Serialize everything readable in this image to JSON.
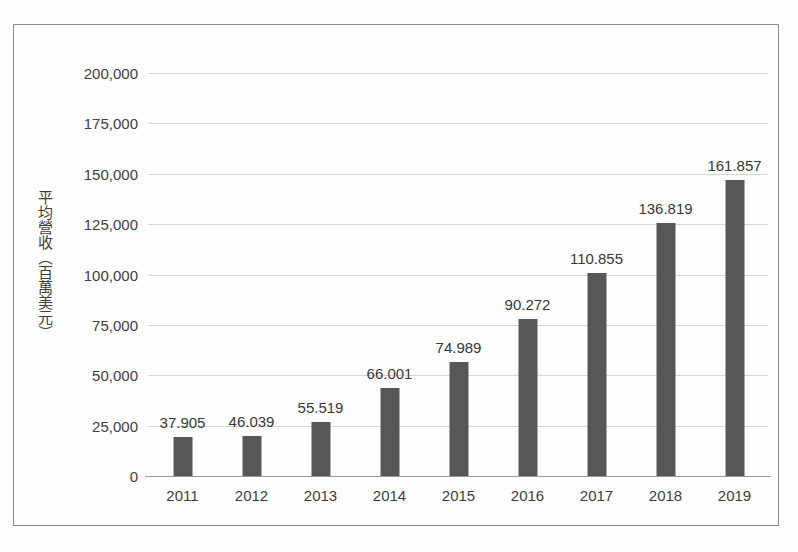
{
  "chart_data": {
    "type": "bar",
    "title": "",
    "subtitle": "",
    "xlabel": "",
    "ylabel": "平均營收（百萬美元）",
    "categories": [
      "2011",
      "2012",
      "2013",
      "2014",
      "2015",
      "2016",
      "2017",
      "2018",
      "2019"
    ],
    "values": [
      37.905,
      46.039,
      55.519,
      66.001,
      74.989,
      90.272,
      110.855,
      136.819,
      161.857
    ],
    "value_labels": [
      "37.905",
      "46.039",
      "55.519",
      "66.001",
      "74.989",
      "90.272",
      "110.855",
      "136.819",
      "161.857"
    ],
    "bar_plotted_values": [
      19500,
      20000,
      27000,
      43500,
      56500,
      78000,
      101000,
      125500,
      147000
    ],
    "ylim": [
      0,
      200000
    ],
    "ytick_labels": [
      "200,000",
      "175,000",
      "150,000",
      "125,000",
      "100,000",
      "75,000",
      "50,000",
      "25,000",
      "0"
    ],
    "ytick_values": [
      200000,
      175000,
      150000,
      125000,
      100000,
      75000,
      50000,
      25000,
      0
    ],
    "grid": true,
    "legend": "none",
    "bar_color": "#575757",
    "gridline_color": "#d6d6d6",
    "axis_color": "#9a9a9a",
    "frame_color": "#8d8d8d",
    "background_color": "#fefefe",
    "text_color": "#3d3d3d"
  }
}
